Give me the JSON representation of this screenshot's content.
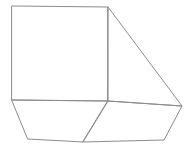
{
  "figure": {
    "background_color": "#ffffff",
    "stroke_color": "#8c8c8c",
    "stroke_width": 1,
    "shapes": [
      {
        "name": "square-face",
        "points": "12,6 108,7 108,101 12,100"
      },
      {
        "name": "triangle-face",
        "points": "108,7 182,106 108,101"
      },
      {
        "name": "bottom-left-quad-face",
        "points": "12,100 108,101 83,142 28,139"
      },
      {
        "name": "bottom-right-quad-face",
        "points": "108,101 182,106 164,140 83,142"
      }
    ]
  }
}
